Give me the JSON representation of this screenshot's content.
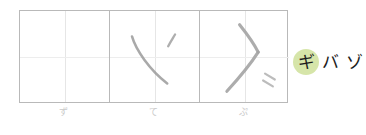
{
  "worksheet": {
    "title": "kana handwriting practice grid",
    "grid": {
      "columns": 3,
      "guide_lines": "crosshair",
      "border_color": "#b9b9b9",
      "guide_color": "#e6e6e6"
    },
    "cells": [
      {
        "index": 1,
        "label": "ず",
        "written": false,
        "strokes": [],
        "ink_color": "#9a9a9a"
      },
      {
        "index": 2,
        "label": "て",
        "written": true,
        "strokes": [
          {
            "name": "long-diagonal-sweep",
            "path": "M 22 26 C 26 40 40 60 58 74"
          },
          {
            "name": "short-upper-right-tick",
            "path": "M 66 24 C 63 29 61 32 59 36"
          }
        ],
        "ink_color": "#9a9a9a"
      },
      {
        "index": 3,
        "label": "ぷ",
        "written": true,
        "strokes": [
          {
            "name": "bent-angle-stroke-upper",
            "path": "M 40 14 C 48 24 55 34 59 42"
          },
          {
            "name": "bent-angle-stroke-lower",
            "path": "M 59 42 C 50 56 38 70 27 82"
          },
          {
            "name": "dakuten-mark-upper",
            "path": "M 66 64 L 76 70"
          },
          {
            "name": "dakuten-mark-lower",
            "path": "M 64 71 L 74 77"
          }
        ],
        "ink_color": "#9a9a9a"
      }
    ]
  },
  "annotation": {
    "highlighted_char": "ギ",
    "following_text": "バ ゾ",
    "highlight_color": "#cfe09a",
    "text_color": "#1c1c1c"
  }
}
